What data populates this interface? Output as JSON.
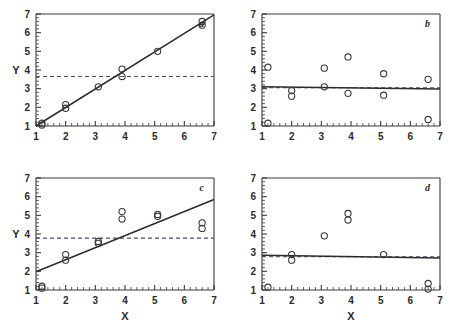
{
  "figure": {
    "panel_count": 4,
    "background_color": "#ffffff",
    "ink_color": "#3a3a3a",
    "marker_color": "#3a3a3a",
    "line_color": "#2c2c2c",
    "dashed_color": "#4a4a6a"
  },
  "axes": {
    "xlabel": "X",
    "ylabel": "Y",
    "xticks": [
      "1",
      "2",
      "3",
      "4",
      "5",
      "6",
      "7"
    ],
    "yticks": [
      "1",
      "2",
      "3",
      "4",
      "5",
      "6",
      "7"
    ],
    "xlim": [
      1,
      7
    ],
    "ylim": [
      1,
      7
    ],
    "minor_ticks": true,
    "grid": false
  },
  "chart_data": [
    {
      "type": "scatter",
      "panel": "a",
      "label": "a",
      "title": "",
      "xlabel": "",
      "ylabel": "Y",
      "xlim": [
        1,
        7
      ],
      "ylim": [
        1,
        7
      ],
      "grid": false,
      "legend_position": "none",
      "x": [
        1.2,
        1.2,
        2.0,
        2.0,
        3.1,
        3.9,
        3.9,
        5.1,
        6.6,
        6.6
      ],
      "y": [
        1.15,
        1.05,
        2.15,
        1.95,
        3.1,
        4.05,
        3.65,
        5.0,
        6.6,
        6.4
      ],
      "fit_line": {
        "x0": 1.0,
        "y0": 1.0,
        "x1": 7.0,
        "y1": 6.95,
        "style": "solid"
      },
      "reference_line": {
        "y": 3.65,
        "style": "dashed",
        "orientation": "horizontal"
      }
    },
    {
      "type": "scatter",
      "panel": "b",
      "label": "b",
      "title": "",
      "xlabel": "",
      "ylabel": "",
      "xlim": [
        1,
        7
      ],
      "ylim": [
        1,
        7
      ],
      "grid": false,
      "legend_position": "none",
      "x": [
        1.2,
        1.2,
        2.0,
        2.0,
        3.1,
        3.1,
        3.9,
        3.9,
        5.1,
        5.1,
        6.6,
        6.6
      ],
      "y": [
        4.15,
        1.15,
        2.9,
        2.6,
        4.1,
        3.1,
        4.7,
        2.75,
        3.8,
        2.65,
        3.5,
        1.35
      ],
      "fit_line": {
        "x0": 1.0,
        "y0": 3.1,
        "x1": 7.0,
        "y1": 2.98,
        "style": "solid"
      },
      "reference_line": {
        "y": 3.05,
        "style": "dashed",
        "orientation": "horizontal"
      }
    },
    {
      "type": "scatter",
      "panel": "c",
      "label": "c",
      "title": "",
      "xlabel": "X",
      "ylabel": "Y",
      "xlim": [
        1,
        7
      ],
      "ylim": [
        1,
        7
      ],
      "grid": false,
      "legend_position": "none",
      "x": [
        1.2,
        1.2,
        2.0,
        2.0,
        3.1,
        3.1,
        3.9,
        3.9,
        5.1,
        5.1,
        6.6,
        6.6
      ],
      "y": [
        1.2,
        1.1,
        2.9,
        2.6,
        3.6,
        3.5,
        5.2,
        4.8,
        5.05,
        4.95,
        4.6,
        4.3
      ],
      "fit_line": {
        "x0": 1.0,
        "y0": 1.98,
        "x1": 7.0,
        "y1": 5.85,
        "style": "solid"
      },
      "reference_line": {
        "y": 3.78,
        "style": "dashed",
        "orientation": "horizontal"
      }
    },
    {
      "type": "scatter",
      "panel": "d",
      "label": "d",
      "title": "",
      "xlabel": "X",
      "ylabel": "",
      "xlim": [
        1,
        7
      ],
      "ylim": [
        1,
        7
      ],
      "grid": false,
      "legend_position": "none",
      "x": [
        1.2,
        2.0,
        2.0,
        3.1,
        3.9,
        3.9,
        5.1,
        6.6,
        6.6
      ],
      "y": [
        1.15,
        2.9,
        2.6,
        3.9,
        5.1,
        4.75,
        2.9,
        1.35,
        1.05
      ],
      "fit_line": {
        "x0": 1.0,
        "y0": 2.86,
        "x1": 7.0,
        "y1": 2.72,
        "style": "solid"
      },
      "reference_line": {
        "y": 2.78,
        "style": "dashed",
        "orientation": "horizontal"
      }
    }
  ]
}
